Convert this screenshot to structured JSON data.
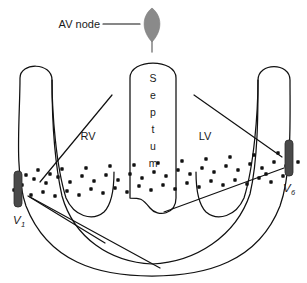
{
  "figure": {
    "background_color": "#ffffff",
    "outline_color": "#111111",
    "av_node_color": "#8a8a8a",
    "electrode_color": "#4a4a4a",
    "dot_color": "#111111"
  },
  "labels": {
    "av_node": "AV node",
    "rv": "RV",
    "lv": "LV",
    "septum_letters": [
      "S",
      "e",
      "p",
      "t",
      "u",
      "m"
    ],
    "septum_full": "Septum",
    "v1": "V",
    "v1_sub": "1",
    "v6": "V",
    "v6_sub": "6"
  },
  "electrodes": [
    {
      "name": "V1",
      "label": "V",
      "subscript": "1",
      "side": "left",
      "x": 19,
      "y": 188
    },
    {
      "name": "V6",
      "label": "V",
      "subscript": "6",
      "side": "right",
      "x": 288,
      "y": 160
    }
  ],
  "av_node": {
    "label": "AV node",
    "shape": "lens",
    "center_x": 152,
    "center_y": 25,
    "color": "#8a8a8a"
  },
  "chambers": [
    {
      "name": "RV",
      "label": "RV",
      "x": 88,
      "y": 137
    },
    {
      "name": "LV",
      "label": "LV",
      "x": 203,
      "y": 137
    },
    {
      "name": "Septum",
      "label": "Septum",
      "x": 152,
      "y": 130
    }
  ],
  "purkinje_dots": {
    "description": "Purkinje fiber network dot band",
    "count": 62,
    "points": [
      [
        22,
        185
      ],
      [
        34,
        179
      ],
      [
        46,
        183
      ],
      [
        58,
        177
      ],
      [
        70,
        182
      ],
      [
        82,
        176
      ],
      [
        94,
        181
      ],
      [
        106,
        175
      ],
      [
        118,
        180
      ],
      [
        130,
        174
      ],
      [
        142,
        178
      ],
      [
        154,
        172
      ],
      [
        166,
        176
      ],
      [
        178,
        170
      ],
      [
        190,
        174
      ],
      [
        202,
        168
      ],
      [
        214,
        172
      ],
      [
        226,
        166
      ],
      [
        238,
        170
      ],
      [
        250,
        164
      ],
      [
        262,
        168
      ],
      [
        274,
        162
      ],
      [
        286,
        166
      ],
      [
        31,
        195
      ],
      [
        43,
        192
      ],
      [
        55,
        196
      ],
      [
        67,
        191
      ],
      [
        79,
        195
      ],
      [
        91,
        189
      ],
      [
        103,
        193
      ],
      [
        115,
        188
      ],
      [
        127,
        192
      ],
      [
        139,
        186
      ],
      [
        151,
        190
      ],
      [
        163,
        185
      ],
      [
        175,
        189
      ],
      [
        187,
        183
      ],
      [
        199,
        187
      ],
      [
        211,
        181
      ],
      [
        223,
        185
      ],
      [
        235,
        180
      ],
      [
        247,
        184
      ],
      [
        259,
        178
      ],
      [
        271,
        182
      ],
      [
        283,
        176
      ],
      [
        26,
        175
      ],
      [
        38,
        170
      ],
      [
        50,
        174
      ],
      [
        62,
        169
      ],
      [
        86,
        168
      ],
      [
        110,
        166
      ],
      [
        134,
        165
      ],
      [
        158,
        163
      ],
      [
        182,
        161
      ],
      [
        206,
        159
      ],
      [
        230,
        157
      ],
      [
        254,
        155
      ],
      [
        266,
        174
      ],
      [
        278,
        153
      ],
      [
        290,
        157
      ],
      [
        14,
        190
      ],
      [
        298,
        162
      ]
    ]
  },
  "vector_lines": [
    {
      "name": "rv-vector-upper",
      "x1": 40,
      "y1": 182,
      "x2": 112,
      "y2": 95
    },
    {
      "name": "v1-vector-lower",
      "x1": 28,
      "y1": 196,
      "x2": 105,
      "y2": 243
    },
    {
      "name": "v1-vector-long",
      "x1": 30,
      "y1": 197,
      "x2": 160,
      "y2": 268
    },
    {
      "name": "lv-vector-upper",
      "x1": 194,
      "y1": 95,
      "x2": 282,
      "y2": 157
    },
    {
      "name": "v6-vector-lower",
      "x1": 164,
      "y1": 212,
      "x2": 284,
      "y2": 168
    }
  ]
}
